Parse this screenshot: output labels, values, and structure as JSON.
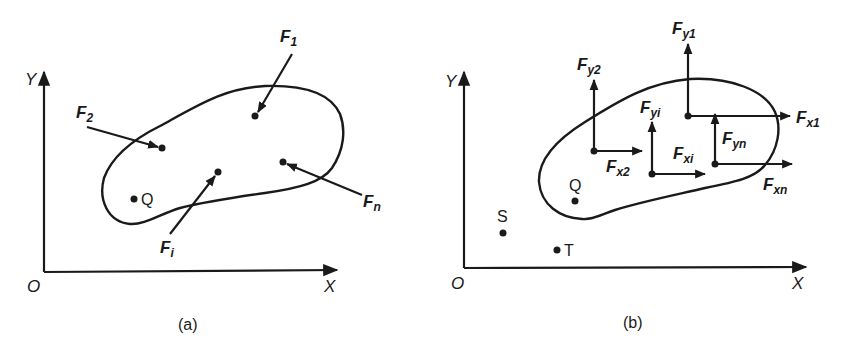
{
  "panel_a": {
    "caption": "(a)",
    "axes": {
      "x_label": "X",
      "y_label": "Y",
      "origin_label": "O"
    },
    "point_label": "Q",
    "forces": [
      {
        "id": "F1",
        "base": "F",
        "sub": "1"
      },
      {
        "id": "F2",
        "base": "F",
        "sub": "2"
      },
      {
        "id": "Fi",
        "base": "F",
        "sub": "i"
      },
      {
        "id": "Fn",
        "base": "F",
        "sub": "n"
      }
    ]
  },
  "panel_b": {
    "caption": "(b)",
    "axes": {
      "x_label": "X",
      "y_label": "Y",
      "origin_label": "O"
    },
    "points": {
      "Q": "Q",
      "S": "S",
      "T": "T"
    },
    "components": [
      {
        "id": "Fy1",
        "base": "F",
        "sub": "y1"
      },
      {
        "id": "Fx1",
        "base": "F",
        "sub": "x1"
      },
      {
        "id": "Fy2",
        "base": "F",
        "sub": "y2"
      },
      {
        "id": "Fx2",
        "base": "F",
        "sub": "x2"
      },
      {
        "id": "Fyi",
        "base": "F",
        "sub": "yi"
      },
      {
        "id": "Fxi",
        "base": "F",
        "sub": "xi"
      },
      {
        "id": "Fyn",
        "base": "F",
        "sub": "yn"
      },
      {
        "id": "Fxn",
        "base": "F",
        "sub": "xn"
      }
    ]
  }
}
